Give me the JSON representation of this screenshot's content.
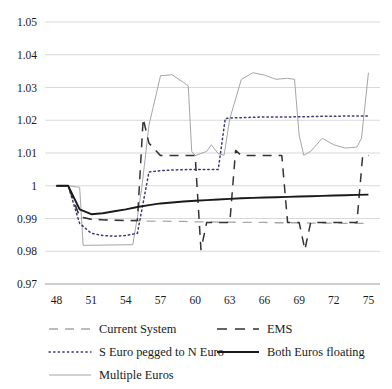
{
  "chart_data": {
    "type": "line",
    "title": "",
    "xlabel": "",
    "ylabel": "",
    "xlim": [
      47,
      76
    ],
    "ylim": [
      0.97,
      1.05
    ],
    "grid": true,
    "legend_position": "bottom",
    "yticks": [
      "1.05",
      "1.04",
      "1.03",
      "1.02",
      "1.01",
      "1",
      "0.99",
      "0.98",
      "0.97"
    ],
    "ytick_values": [
      1.05,
      1.04,
      1.03,
      1.02,
      1.01,
      1.0,
      0.99,
      0.98,
      0.97
    ],
    "xticks": [
      "48",
      "51",
      "54",
      "57",
      "60",
      "63",
      "66",
      "69",
      "72",
      "75"
    ],
    "xtick_values": [
      48,
      51,
      54,
      57,
      60,
      63,
      66,
      69,
      72,
      75
    ],
    "series": [
      {
        "name": "Current System",
        "style": "dashed-light",
        "color": "#a6a6a6",
        "x": [
          48,
          49,
          50,
          51,
          52,
          53,
          54,
          55,
          56,
          57,
          58,
          59,
          60,
          61,
          62,
          63,
          64,
          65,
          66,
          67,
          68,
          69,
          70,
          71,
          72,
          73,
          74,
          75
        ],
        "y": [
          1.0,
          1.0,
          0.9905,
          0.9898,
          0.9896,
          0.9895,
          0.9894,
          0.9893,
          0.9892,
          0.9892,
          0.9891,
          0.9891,
          0.989,
          0.989,
          0.9889,
          0.9889,
          0.9888,
          0.9888,
          0.9888,
          0.9887,
          0.9887,
          0.9887,
          0.9886,
          0.9886,
          0.9886,
          0.9885,
          0.9885,
          0.9885
        ]
      },
      {
        "name": "EMS",
        "style": "dashed-dark",
        "color": "#333333",
        "x": [
          48,
          49,
          50,
          51,
          52,
          53,
          54,
          55,
          55.5,
          56,
          57,
          58,
          59,
          60,
          60.5,
          61,
          62,
          63,
          63.5,
          64,
          65,
          66,
          67,
          67.5,
          68,
          69,
          69.5,
          70,
          71,
          72,
          73,
          74,
          74.5,
          75
        ],
        "y": [
          1.0,
          1.0,
          0.9905,
          0.9898,
          0.9896,
          0.9895,
          0.9894,
          0.9894,
          1.0205,
          1.013,
          1.0092,
          1.0092,
          1.0092,
          1.0092,
          0.9805,
          0.9888,
          0.9888,
          0.9888,
          1.0108,
          1.0092,
          1.0092,
          1.0092,
          1.0092,
          1.0092,
          0.9888,
          0.9888,
          0.9805,
          0.9888,
          0.9888,
          0.9888,
          0.9888,
          0.9888,
          1.0092,
          1.0092
        ]
      },
      {
        "name": "S Euro pegged to N Euro",
        "style": "dotted",
        "color": "#3b3b7a",
        "x": [
          48,
          49,
          50,
          51,
          52,
          53,
          54,
          55,
          56,
          57,
          58,
          59,
          60,
          61,
          62,
          62.6,
          63,
          64,
          65,
          66,
          67,
          68,
          69,
          70,
          71,
          72,
          73,
          74,
          75
        ],
        "y": [
          1.0,
          1.0,
          0.9885,
          0.9855,
          0.9848,
          0.9846,
          0.9848,
          0.9855,
          1.0042,
          1.0046,
          1.0048,
          1.0049,
          1.005,
          1.005,
          1.005,
          1.0205,
          1.0207,
          1.0208,
          1.0209,
          1.021,
          1.021,
          1.021,
          1.0211,
          1.0211,
          1.0212,
          1.0212,
          1.0213,
          1.0213,
          1.0213
        ]
      },
      {
        "name": "Both Euros floating",
        "style": "solid-dark",
        "color": "#1a1a1a",
        "x": [
          48,
          49,
          50,
          51,
          52,
          53,
          54,
          55,
          56,
          57,
          58,
          59,
          60,
          61,
          62,
          63,
          64,
          65,
          66,
          67,
          68,
          69,
          70,
          71,
          72,
          73,
          74,
          75
        ],
        "y": [
          1.0,
          1.0,
          0.9928,
          0.9913,
          0.9916,
          0.9922,
          0.9928,
          0.9935,
          0.9941,
          0.9946,
          0.9949,
          0.9952,
          0.9954,
          0.9956,
          0.9958,
          0.996,
          0.9962,
          0.9963,
          0.9964,
          0.9965,
          0.9966,
          0.9967,
          0.9968,
          0.9969,
          0.997,
          0.9971,
          0.9972,
          0.9973
        ]
      },
      {
        "name": "Multiple Euros",
        "style": "solid-light",
        "color": "#a6a6a6",
        "x": [
          48,
          49,
          50,
          50.3,
          54.6,
          55,
          55.4,
          56,
          57,
          58,
          59,
          59.4,
          59.7,
          60,
          61,
          61.4,
          62,
          62.5,
          63,
          64,
          65,
          66,
          67,
          68,
          68.6,
          69,
          69.4,
          70,
          71,
          72,
          73,
          74,
          74.4,
          75
        ],
        "y": [
          1.0,
          1.0,
          0.9995,
          0.9818,
          0.982,
          0.9905,
          1.0,
          1.0185,
          1.0336,
          1.0339,
          1.0315,
          1.0305,
          1.0105,
          1.0092,
          1.0105,
          1.0125,
          1.0098,
          1.0093,
          1.0205,
          1.0325,
          1.0345,
          1.0338,
          1.0325,
          1.0328,
          1.0325,
          1.0155,
          1.0093,
          1.0105,
          1.0145,
          1.0125,
          1.0115,
          1.0118,
          1.0145,
          1.0345
        ]
      }
    ]
  },
  "legend": {
    "items": [
      {
        "label": "Current System",
        "style": "dashed-light",
        "color": "#a6a6a6"
      },
      {
        "label": "EMS",
        "style": "dashed-dark",
        "color": "#333333"
      },
      {
        "label": "S Euro pegged to N Euro",
        "style": "dotted",
        "color": "#3b3b7a"
      },
      {
        "label": "Both Euros floating",
        "style": "solid-dark",
        "color": "#1a1a1a"
      },
      {
        "label": "Multiple Euros",
        "style": "solid-light",
        "color": "#a6a6a6"
      }
    ]
  },
  "axes": {
    "gridline_color": "#d9d9d9",
    "text_color": "#1a1a1a"
  }
}
